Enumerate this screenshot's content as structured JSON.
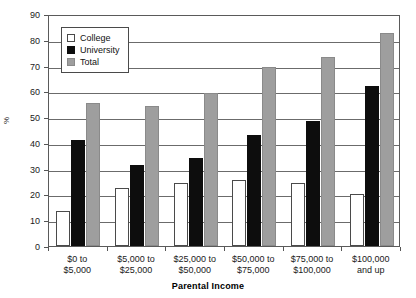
{
  "chart_data": {
    "type": "bar",
    "title": "",
    "xlabel": "Parental Income",
    "ylabel": "%",
    "ylim": [
      0,
      90
    ],
    "ytick_step": 10,
    "yticks": [
      0,
      10,
      20,
      30,
      40,
      50,
      60,
      70,
      80,
      90
    ],
    "grid": true,
    "legend_position": "upper-left-inside",
    "categories": [
      "$0 to\n$5,000",
      "$5,000 to\n$25,000",
      "$25,000 to\n$50,000",
      "$50,000 to\n$75,000",
      "$75,000 to\n$100,000",
      "$100,000\nand up"
    ],
    "category_lines": [
      [
        "$0 to",
        "$5,000"
      ],
      [
        "$5,000 to",
        "$25,000"
      ],
      [
        "$25,000 to",
        "$50,000"
      ],
      [
        "$50,000 to",
        "$75,000"
      ],
      [
        "$75,000 to",
        "$100,000"
      ],
      [
        "$100,000",
        "and up"
      ]
    ],
    "series": [
      {
        "name": "College",
        "color": "#ffffff",
        "values": [
          13.5,
          22.5,
          24.5,
          25.5,
          24.3,
          20.0
        ]
      },
      {
        "name": "University",
        "color": "#0d0d0d",
        "values": [
          41.0,
          31.5,
          34.0,
          43.0,
          48.5,
          62.0
        ]
      },
      {
        "name": "Total",
        "color": "#9e9e9e",
        "values": [
          55.5,
          54.5,
          59.5,
          69.5,
          73.5,
          82.5
        ]
      }
    ]
  },
  "legend": {
    "items": [
      {
        "label": "College",
        "swatch": "white-square"
      },
      {
        "label": "University",
        "swatch": "black-square"
      },
      {
        "label": "Total",
        "swatch": "gray-square"
      }
    ]
  },
  "axes": {
    "y_title": "%",
    "x_title": "Parental Income"
  },
  "colors": {
    "college": "#ffffff",
    "university": "#0d0d0d",
    "total": "#9e9e9e",
    "axis": "#5a5a5a",
    "grid": "#6b6b6b",
    "text": "#1a1a1a"
  }
}
